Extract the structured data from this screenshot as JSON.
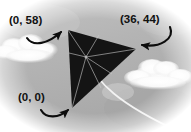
{
  "scene": {
    "title": "Kite vertex coordinate diagram",
    "background_sky_color": "#b5b5b5",
    "background_edge_color": "#ffffff",
    "cloud_color": "#fdfdfd",
    "kite_color": "#141414",
    "kite_spar_color": "#cfcfcf",
    "tail_color": "#f4f4f4",
    "arrow_color": "#0d0d0d",
    "label_color": "#111111"
  },
  "labels": [
    {
      "id": "top-left",
      "text": "(0, 58)",
      "x": 0,
      "y": 58,
      "points_to": "kite-top-vertex"
    },
    {
      "id": "top-right",
      "text": "(36, 44)",
      "x": 36,
      "y": 44,
      "points_to": "kite-right-vertex"
    },
    {
      "id": "origin",
      "text": "(0, 0)",
      "x": 0,
      "y": 0,
      "points_to": "kite-bottom-vertex"
    }
  ],
  "kite": {
    "name": "triangular-kite",
    "vertices": [
      {
        "name": "top",
        "px": [
          68,
          30
        ],
        "coord": [
          0,
          58
        ]
      },
      {
        "name": "right",
        "px": [
          136,
          49
        ],
        "coord": [
          36,
          44
        ]
      },
      {
        "name": "bottom",
        "px": [
          72,
          108
        ],
        "coord": [
          0,
          0
        ]
      }
    ],
    "center_px": [
      86,
      57
    ],
    "spar_count": 6,
    "tail": {
      "from_px": [
        86,
        57
      ],
      "to_px": [
        178,
        131
      ]
    }
  },
  "clouds": [
    {
      "id": "cloud-left",
      "px": [
        6,
        38
      ],
      "w": 60,
      "h": 28
    },
    {
      "id": "cloud-right",
      "px": [
        126,
        58
      ],
      "w": 62,
      "h": 30
    }
  ],
  "arrows": [
    {
      "id": "arrow-to-top-vertex",
      "from_px": [
        26,
        40
      ],
      "to_px": [
        62,
        31
      ],
      "direction": "up-right"
    },
    {
      "id": "arrow-to-right-vertex",
      "from_px": [
        171,
        30
      ],
      "to_px": [
        141,
        46
      ],
      "direction": "down-left"
    },
    {
      "id": "arrow-to-bottom-vertex",
      "from_px": [
        42,
        113
      ],
      "to_px": [
        69,
        110
      ],
      "direction": "up-right"
    }
  ]
}
